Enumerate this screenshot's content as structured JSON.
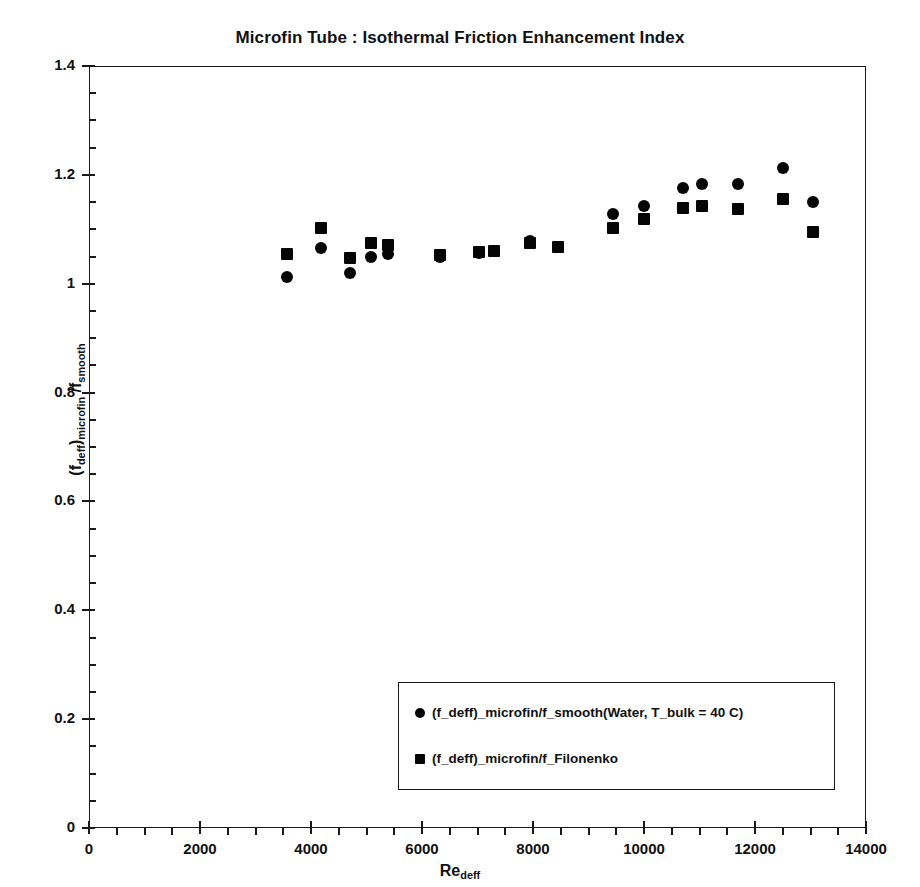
{
  "chart_data": {
    "type": "scatter",
    "title": "Microfin Tube : Isothermal Friction Enhancement Index",
    "xlabel": "Re_deff",
    "xlabel_base": "Re",
    "xlabel_sub": "deff",
    "ylabel": "(f_deff)_microfin / f_smooth",
    "ylabel_parts": {
      "p1": "(f",
      "s1": "deff",
      "p2": ")",
      "s2": "microfin",
      "p3": " /f",
      "s3": "smooth"
    },
    "xlim": [
      0,
      14000
    ],
    "ylim": [
      0,
      1.4
    ],
    "xticks": [
      0,
      2000,
      4000,
      6000,
      8000,
      10000,
      12000,
      14000
    ],
    "xtick_labels": [
      "0",
      "2000",
      "4000",
      "6000",
      "8000",
      "10000",
      "12000",
      "14000"
    ],
    "yticks": [
      0,
      0.2,
      0.4,
      0.6,
      0.8,
      1,
      1.2,
      1.4
    ],
    "ytick_labels": [
      "0",
      "0.2",
      "0.4",
      "0.6",
      "0.8",
      "1",
      "1.2",
      "1.4"
    ],
    "x_minor_interval": 500,
    "y_minor_interval": 0.05,
    "grid": false,
    "legend_position": "lower right",
    "marker_color": "#050505",
    "axis_color": "#1a1a1a",
    "background": "#ffffff",
    "series": [
      {
        "name": "(f_deff)_microfin/f_smooth(Water, T_bulk = 40 C)",
        "marker": "circle",
        "points": [
          {
            "x": 3560,
            "y": 1.012
          },
          {
            "x": 4180,
            "y": 1.065
          },
          {
            "x": 4700,
            "y": 1.02
          },
          {
            "x": 5080,
            "y": 1.05
          },
          {
            "x": 5380,
            "y": 1.055
          },
          {
            "x": 6320,
            "y": 1.05
          },
          {
            "x": 7020,
            "y": 1.057
          },
          {
            "x": 7950,
            "y": 1.078
          },
          {
            "x": 8450,
            "y": 1.068
          },
          {
            "x": 9450,
            "y": 1.128
          },
          {
            "x": 10000,
            "y": 1.143
          },
          {
            "x": 10700,
            "y": 1.175
          },
          {
            "x": 11050,
            "y": 1.183
          },
          {
            "x": 11700,
            "y": 1.183
          },
          {
            "x": 12500,
            "y": 1.212
          },
          {
            "x": 13050,
            "y": 1.15
          }
        ]
      },
      {
        "name": "(f_deff)_microfin/f_Filonenko",
        "marker": "square",
        "points": [
          {
            "x": 3560,
            "y": 1.055
          },
          {
            "x": 4180,
            "y": 1.102
          },
          {
            "x": 4700,
            "y": 1.047
          },
          {
            "x": 5080,
            "y": 1.075
          },
          {
            "x": 5380,
            "y": 1.072
          },
          {
            "x": 6320,
            "y": 1.052
          },
          {
            "x": 7020,
            "y": 1.058
          },
          {
            "x": 7300,
            "y": 1.06
          },
          {
            "x": 7950,
            "y": 1.075
          },
          {
            "x": 8450,
            "y": 1.068
          },
          {
            "x": 9450,
            "y": 1.102
          },
          {
            "x": 10000,
            "y": 1.118
          },
          {
            "x": 10700,
            "y": 1.14
          },
          {
            "x": 11050,
            "y": 1.143
          },
          {
            "x": 11700,
            "y": 1.137
          },
          {
            "x": 12500,
            "y": 1.155
          },
          {
            "x": 13050,
            "y": 1.095
          }
        ]
      }
    ]
  }
}
